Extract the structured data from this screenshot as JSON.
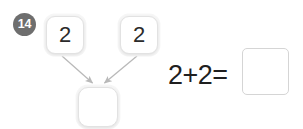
{
  "worksheet": {
    "question_number": "14",
    "accent_badge_color": "#6e6e6e",
    "box_border_color": "#e2e2e2",
    "arrow_color": "#b9b9b9",
    "text_color": "#2b2b2b"
  },
  "part_whole_diagram": {
    "addend_left": "2",
    "addend_right": "2",
    "sum": "",
    "arrow_left_label": "arrow-to-sum-left",
    "arrow_right_label": "arrow-to-sum-right"
  },
  "number_sentence": {
    "expression": "2+2=",
    "answer": "",
    "operands": [
      "2",
      "2"
    ],
    "operator": "+",
    "equals": "="
  }
}
